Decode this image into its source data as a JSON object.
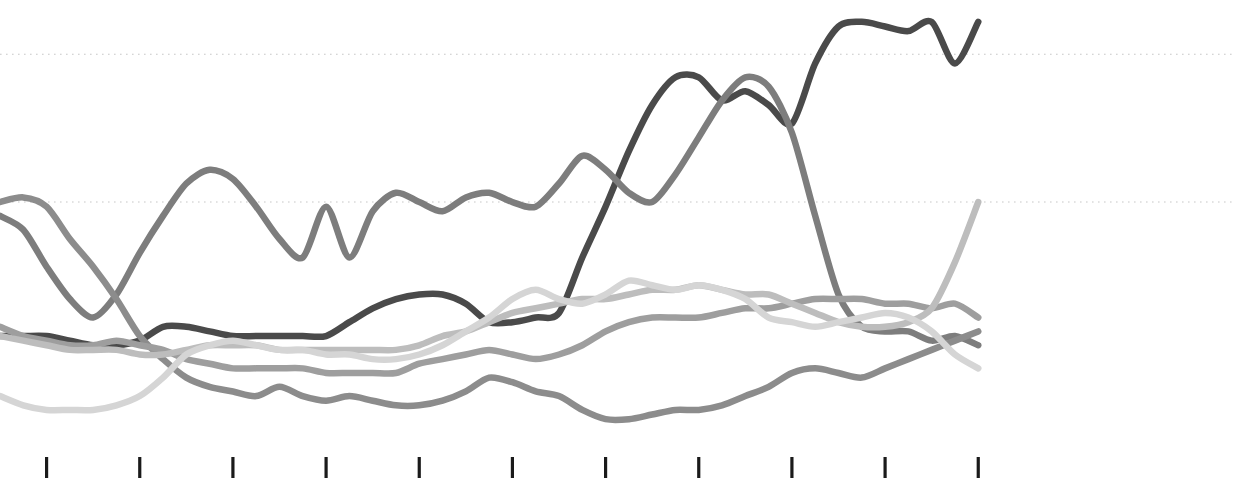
{
  "chart_data": {
    "type": "line",
    "title": "",
    "subtitle": "",
    "xlabel": "",
    "ylabel": "",
    "grid": true,
    "legend_position": "none",
    "axis": {
      "xlim": [
        0,
        48
      ],
      "ylim": [
        0,
        100
      ],
      "x_tick_values": [
        2,
        6,
        10,
        14,
        18,
        22,
        26,
        30,
        34,
        38,
        42
      ],
      "x_tick_labels": [
        "",
        "",
        "",
        "",
        "",
        "",
        "",
        "",
        "",
        "",
        ""
      ],
      "y_gridline_values": [
        58,
        90
      ],
      "y_tick_labels": []
    },
    "style": {
      "background": "#ffffff",
      "gridline_color": "#c8c8c8",
      "tick_color": "#1a1a1a",
      "line_width_px": 6.5
    },
    "x": [
      0,
      1,
      2,
      3,
      4,
      5,
      6,
      7,
      8,
      9,
      10,
      11,
      12,
      13,
      14,
      15,
      16,
      17,
      18,
      19,
      20,
      21,
      22,
      23,
      24,
      25,
      26,
      27,
      28,
      29,
      30,
      31,
      32,
      33,
      34,
      35,
      36,
      37,
      38,
      39,
      40,
      41,
      42
    ],
    "series": [
      {
        "name": "series-1-darkest",
        "color": "#4a4a4a",
        "values": [
          29,
          29,
          29,
          28,
          27,
          27,
          28,
          31,
          31,
          30,
          29,
          29,
          29,
          29,
          29,
          32,
          35,
          37,
          38,
          38,
          36,
          32,
          32,
          33,
          34,
          46,
          57,
          69,
          79,
          85,
          85,
          80,
          82,
          79,
          75,
          88,
          96,
          97,
          96,
          95,
          97,
          88,
          97
        ]
      },
      {
        "name": "series-2-mid-dark",
        "color": "#7d7d7d",
        "values": [
          55,
          52,
          44,
          37,
          33,
          38,
          47,
          55,
          62,
          65,
          63,
          57,
          50,
          46,
          57,
          46,
          56,
          60,
          58,
          56,
          59,
          60,
          58,
          57,
          62,
          68,
          65,
          60,
          58,
          64,
          72,
          80,
          85,
          83,
          73,
          55,
          38,
          31,
          30,
          30,
          28,
          29,
          27
        ]
      },
      {
        "name": "series-3-mid",
        "color": "#8c8c8c",
        "values": [
          58,
          59,
          57,
          50,
          44,
          37,
          29,
          24,
          20,
          18,
          17,
          16,
          18,
          16,
          15,
          16,
          15,
          14,
          14,
          15,
          17,
          20,
          19,
          17,
          16,
          13,
          11,
          11,
          12,
          13,
          13,
          14,
          16,
          18,
          21,
          22,
          21,
          20,
          22,
          24,
          26,
          28,
          30
        ]
      },
      {
        "name": "series-4-mid-light",
        "color": "#9e9e9e",
        "values": [
          31,
          29,
          28,
          27,
          27,
          28,
          27,
          26,
          24,
          23,
          22,
          22,
          22,
          22,
          21,
          21,
          21,
          21,
          23,
          24,
          25,
          26,
          25,
          24,
          25,
          27,
          30,
          32,
          33,
          33,
          33,
          34,
          35,
          35,
          36,
          37,
          37,
          37,
          36,
          36,
          35,
          36,
          33
        ]
      },
      {
        "name": "series-5-light",
        "color": "#bdbdbd",
        "values": [
          29,
          28,
          27,
          26,
          26,
          26,
          25,
          25,
          26,
          27,
          27,
          27,
          26,
          26,
          26,
          26,
          26,
          26,
          27,
          29,
          30,
          32,
          34,
          35,
          36,
          37,
          37,
          38,
          39,
          39,
          40,
          39,
          38,
          38,
          36,
          34,
          32,
          31,
          31,
          32,
          35,
          45,
          58
        ]
      },
      {
        "name": "series-6-lightest",
        "color": "#d5d5d5",
        "values": [
          16,
          14,
          13,
          13,
          13,
          14,
          16,
          20,
          25,
          27,
          28,
          27,
          26,
          26,
          25,
          25,
          24,
          24,
          25,
          27,
          30,
          33,
          37,
          39,
          37,
          36,
          38,
          41,
          40,
          39,
          40,
          39,
          37,
          33,
          32,
          31,
          32,
          33,
          34,
          33,
          30,
          25,
          22
        ]
      }
    ]
  }
}
